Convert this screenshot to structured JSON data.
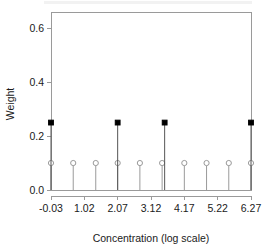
{
  "chart_data": {
    "type": "scatter",
    "title": "",
    "xlabel": "Concentration (log scale)",
    "ylabel": "Weight",
    "xlim": [
      -0.03,
      6.27
    ],
    "ylim": [
      0.0,
      0.66
    ],
    "grid": false,
    "legend": null,
    "xticks": [
      "-0.03",
      "1.02",
      "2.07",
      "3.12",
      "4.17",
      "5.22",
      "6.27"
    ],
    "xtick_values": [
      -0.03,
      1.02,
      2.07,
      3.12,
      4.17,
      5.22,
      6.27
    ],
    "yticks": [
      "0.0",
      "0.2",
      "0.4",
      "0.6"
    ],
    "ytick_values": [
      0.0,
      0.2,
      0.4,
      0.6
    ],
    "series": [
      {
        "name": "open-circle weights",
        "marker": "open-circle",
        "color": "#9a9a9a",
        "x": [
          -0.03,
          0.67,
          1.38,
          2.07,
          2.77,
          3.47,
          4.17,
          4.87,
          5.57,
          6.27
        ],
        "values": [
          0.1,
          0.1,
          0.1,
          0.1,
          0.1,
          0.1,
          0.1,
          0.1,
          0.1,
          0.1
        ]
      },
      {
        "name": "filled-square weights",
        "marker": "filled-square",
        "color": "#000000",
        "x": [
          -0.03,
          2.07,
          3.55,
          6.27
        ],
        "values": [
          0.25,
          0.25,
          0.25,
          0.25
        ]
      }
    ]
  },
  "axes": {
    "x_title": "Concentration (log scale)",
    "y_title": "Weight"
  }
}
